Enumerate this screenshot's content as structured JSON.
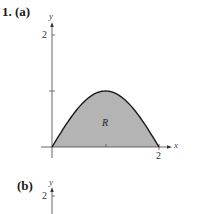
{
  "problem": {
    "number_label": "1.",
    "part_a_label": "(a)",
    "part_b_label": "(b)"
  },
  "chart_data": [
    {
      "type": "area",
      "panel": "(a)",
      "title": "",
      "xlabel": "x",
      "ylabel": "y",
      "x_ticks": [
        {
          "value": 1,
          "label": ""
        },
        {
          "value": 2,
          "label": "2"
        }
      ],
      "y_ticks": [
        {
          "value": 1,
          "label": ""
        },
        {
          "value": 2,
          "label": "2"
        }
      ],
      "xlim": [
        0,
        2
      ],
      "ylim": [
        0,
        2
      ],
      "grid": false,
      "region_label": "R",
      "region_fill": "#b4b4b4",
      "curve_color": "#1a1a1a",
      "curve": {
        "description": "arch from (0,0) to (2,0) with maximum 1 at x=1",
        "x": [
          0,
          0.25,
          0.5,
          0.75,
          1,
          1.25,
          1.5,
          1.75,
          2
        ],
        "y": [
          0,
          0.38,
          0.71,
          0.92,
          1,
          0.92,
          0.71,
          0.38,
          0
        ]
      }
    },
    {
      "type": "area",
      "panel": "(b)",
      "xlabel": "",
      "ylabel": "y",
      "y_ticks": [
        {
          "value": 2,
          "label": "2"
        }
      ],
      "note": "cropped; only top of y-axis visible"
    }
  ]
}
